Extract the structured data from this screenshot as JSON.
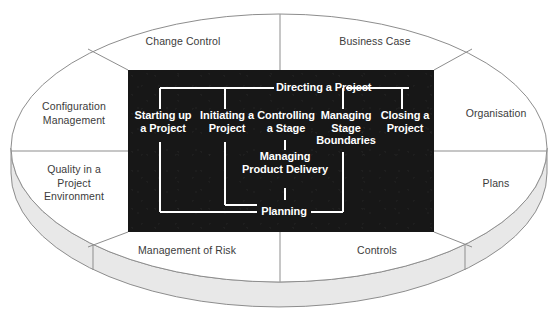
{
  "diagram": {
    "type": "concentric-process-diagram",
    "colors": {
      "background": "#ffffff",
      "process_box_fill": "#171717",
      "process_text": "#ffffff",
      "ellipse_outline": "#8d8d8d",
      "theme_text": "#3b3b3b",
      "disc_side_fill": "#e6e6e6",
      "disc_side_outline": "#8d8d8d"
    }
  },
  "components": {
    "note": "Eight PRINCE2 component labels arranged around the outer ellipse",
    "top_left": "Change Control",
    "top_right": "Business Case",
    "left_upper": "Configuration\nManagement",
    "left_lower": "Quality in a\nProject\nEnvironment",
    "right_upper": "Organisation",
    "right_lower": "Plans",
    "bottom_left": "Management of Risk",
    "bottom_right": "Controls"
  },
  "processes": {
    "note": "PRINCE2 processes inside the dark central panel",
    "directing": "Directing a Project",
    "starting_up": "Starting up\na Project",
    "initiating": "Initiating a\nProject",
    "controlling": "Controlling\na Stage",
    "managing_boundaries": "Managing\nStage\nBoundaries",
    "closing": "Closing a\nProject",
    "managing_delivery": "Managing\nProduct Delivery",
    "planning": "Planning"
  }
}
